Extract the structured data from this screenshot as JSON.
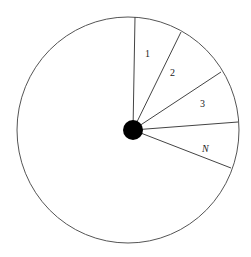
{
  "diagram": {
    "type": "wheel-with-sectors",
    "sectors": [
      {
        "label": "1"
      },
      {
        "label": "2"
      },
      {
        "label": "3"
      },
      {
        "label": "N"
      }
    ],
    "colors": {
      "outline": "#555555",
      "hub": "#000000",
      "background": "#ffffff"
    }
  }
}
